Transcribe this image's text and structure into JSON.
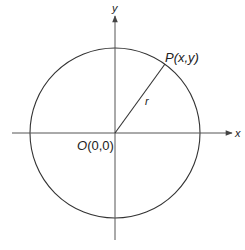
{
  "diagram": {
    "colors": {
      "stroke": "#333333",
      "axis": "#555555",
      "text": "#222222",
      "background": "#ffffff"
    },
    "labels": {
      "y_axis": "y",
      "x_axis": "x",
      "point": "P(x,y)",
      "point_letter": "P",
      "point_coords": "(x,y)",
      "radius": "r",
      "origin": "O(0,0)",
      "origin_letter": "O",
      "origin_coords": "(0,0)"
    },
    "geometry": {
      "origin": [
        115,
        133
      ],
      "radius_px": 85,
      "point": [
        165,
        64
      ],
      "x_axis_range": [
        12,
        232
      ],
      "y_axis_range": [
        16,
        240
      ]
    }
  }
}
